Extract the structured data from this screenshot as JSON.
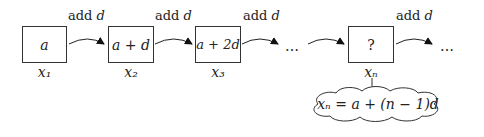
{
  "boxes": [
    {
      "content": "a",
      "label": "x₁"
    },
    {
      "content": "a + d",
      "label": "x₂"
    },
    {
      "content": "a + 2d",
      "label": "x₃"
    },
    {
      "content": "?",
      "label": "xₙ"
    }
  ],
  "arrow_labels": [
    "add",
    "add",
    "add",
    "add"
  ],
  "arrow_var": "d",
  "ellipsis": "…",
  "formula": "xₙ = a + (n − 1)d"
}
